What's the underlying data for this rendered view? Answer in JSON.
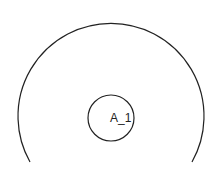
{
  "diagram": {
    "outer_arc": {
      "cx": 111,
      "cy": 117,
      "r": 93,
      "start": [
        30,
        162
      ],
      "end": [
        192,
        162
      ],
      "stroke": "#222222"
    },
    "inner_circle": {
      "cx": 111,
      "cy": 118,
      "r": 23,
      "stroke": "#222222",
      "label": "A_1"
    },
    "background": "#ffffff"
  }
}
